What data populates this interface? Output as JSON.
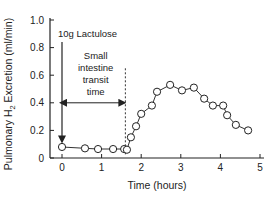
{
  "chart_data": {
    "type": "line",
    "title": "",
    "xlabel": "Time (hours)",
    "ylabel": "Pulmonary H₂ Excretion (ml/min)",
    "ylabel_parts": [
      "Pulmonary H",
      "2",
      " Excretion (ml/min)"
    ],
    "xlim": [
      0,
      5
    ],
    "ylim": [
      0,
      1.0
    ],
    "xticks": [
      0,
      1,
      2,
      3,
      4,
      5
    ],
    "xtick_labels": [
      "0",
      "1",
      "2",
      "3",
      "4",
      "5"
    ],
    "yticks": [
      0,
      0.2,
      0.4,
      0.6,
      0.8,
      1.0
    ],
    "ytick_labels": [
      "0",
      "0.2",
      "0.4",
      "0.6",
      "0.8",
      "1.0"
    ],
    "grid": false,
    "legend": null,
    "series": [
      {
        "name": "H2 excretion",
        "marker": "open-circle",
        "x": [
          0,
          0.58,
          0.91,
          1.29,
          1.57,
          1.64,
          1.74,
          1.87,
          2.0,
          2.27,
          2.4,
          2.73,
          3.03,
          3.33,
          3.59,
          3.81,
          4.07,
          4.17,
          4.39,
          4.7
        ],
        "y": [
          0.08,
          0.07,
          0.065,
          0.065,
          0.065,
          0.06,
          0.15,
          0.23,
          0.32,
          0.38,
          0.48,
          0.53,
          0.49,
          0.51,
          0.43,
          0.38,
          0.38,
          0.31,
          0.24,
          0.2
        ]
      }
    ],
    "annotations": [
      {
        "text": "10g Lactulose",
        "type": "arrow-down",
        "x": 0,
        "y_from": 0.84,
        "y_to": 0.12
      },
      {
        "text": "Small intestine transit time",
        "lines": [
          "Small",
          "intestine",
          "transit",
          "time"
        ],
        "type": "double-arrow",
        "x_from": 0,
        "x_to": 1.6,
        "y": 0.4
      },
      {
        "text": "",
        "type": "dashed-vline",
        "x": 1.6,
        "y_from": 0.02,
        "y_to": 0.65
      }
    ]
  }
}
